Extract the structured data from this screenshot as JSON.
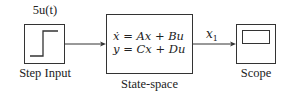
{
  "diagram": {
    "type": "block-diagram",
    "blocks": {
      "step": {
        "param_label": "5u(t)",
        "name_label": "Step Input",
        "icon": "step-signal-icon"
      },
      "statespace": {
        "equation_line1": "ẋ = Ax + Bu",
        "equation_line2": "y = Cx + Du",
        "name_label": "State-space"
      },
      "scope": {
        "name_label": "Scope",
        "icon": "scope-screen-icon"
      }
    },
    "signals": [
      {
        "from": "step",
        "to": "statespace",
        "label": ""
      },
      {
        "from": "statespace",
        "to": "scope",
        "label": "x1"
      }
    ],
    "signal_label_main": "x",
    "signal_label_sub": "1",
    "colors": {
      "line": "#333333",
      "background": "#ffffff"
    }
  }
}
